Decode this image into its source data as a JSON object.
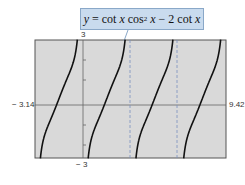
{
  "chart_data": {
    "type": "line",
    "function": "y = cot(x)*cos(x)^2 - 2*cot(x)",
    "xlim": [
      -3.14,
      9.42
    ],
    "ylim": [
      -3,
      3
    ],
    "x_tick_labels": [
      "-3.14",
      "9.42"
    ],
    "y_tick_labels": [
      "3",
      "-3"
    ],
    "y_ticks_step": 1,
    "vertical_asymptotes": [
      0,
      3.14159,
      6.28319
    ],
    "dashed_asymptotes_shown": [
      3.14159,
      6.28319
    ],
    "grid": false,
    "background": "#d9d9d9",
    "line_color": "#111111"
  },
  "labels": {
    "callout_y": "y",
    "callout_eq": " = cot ",
    "callout_x1": "x",
    "callout_cos": " cos",
    "callout_sup": "2",
    "callout_x2": " x",
    "callout_rest": " − 2 cot ",
    "callout_x3": "x",
    "ymax": "3",
    "ymin": "− 3",
    "xmin": "− 3.14",
    "xmax": "9.42"
  }
}
